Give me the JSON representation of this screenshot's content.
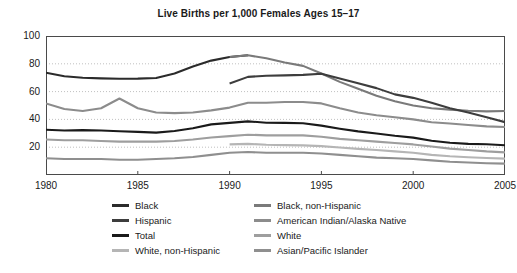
{
  "chart_data": {
    "type": "line",
    "title": "Live Births per 1,000 Females Ages 15–17",
    "xlabel": "",
    "ylabel": "",
    "xlim": [
      1980,
      2005
    ],
    "ylim": [
      0,
      100
    ],
    "grid": true,
    "gridlines_y": [
      20,
      40,
      60,
      80,
      100
    ],
    "legend_position": "bottom",
    "xticks": [
      1980,
      1985,
      1990,
      1995,
      2000,
      2005
    ],
    "xtick_labels": [
      "1980",
      "1985",
      "1990",
      "1995",
      "2000",
      "2005"
    ],
    "yticks": [
      20,
      40,
      60,
      80,
      100
    ],
    "ytick_labels": [
      "20",
      "40",
      "60",
      "80",
      "100"
    ],
    "series": [
      {
        "name": "Black",
        "color": "#2b2b2b",
        "x": [
          1980,
          1981,
          1982,
          1983,
          1984,
          1985,
          1986,
          1987,
          1988,
          1989,
          1990,
          1991
        ],
        "values": [
          73.6,
          71.0,
          70.0,
          69.5,
          69.2,
          69.3,
          69.8,
          73.0,
          78.0,
          82.3,
          84.9,
          86.1
        ]
      },
      {
        "name": "Black, non-Hispanic",
        "color": "#7a7a7a",
        "x": [
          1990,
          1991,
          1992,
          1993,
          1994,
          1995,
          1996,
          1997,
          1998,
          1999,
          2000,
          2001,
          2002,
          2003,
          2004,
          2005
        ],
        "values": [
          84.9,
          86.1,
          84.0,
          81.0,
          78.5,
          73.0,
          67.0,
          62.0,
          57.0,
          53.0,
          50.0,
          48.0,
          47.0,
          46.2,
          45.8,
          46.0
        ]
      },
      {
        "name": "Hispanic",
        "color": "#3d3d3d",
        "x": [
          1990,
          1991,
          1992,
          1993,
          1994,
          1995,
          1996,
          1997,
          1998,
          1999,
          2000,
          2001,
          2002,
          2003,
          2004,
          2005
        ],
        "values": [
          65.9,
          70.6,
          71.4,
          71.7,
          72.0,
          72.8,
          69.5,
          66.0,
          62.5,
          58.0,
          55.5,
          52.0,
          48.0,
          45.0,
          41.5,
          38.0
        ]
      },
      {
        "name": "American Indian/Alaska Native",
        "color": "#8c8c8c",
        "x": [
          1980,
          1981,
          1982,
          1983,
          1984,
          1985,
          1986,
          1987,
          1988,
          1989,
          1990,
          1991,
          1992,
          1993,
          1994,
          1995,
          1996,
          1997,
          1998,
          1999,
          2000,
          2001,
          2002,
          2003,
          2004,
          2005
        ],
        "values": [
          51.5,
          47.5,
          46.0,
          48.0,
          55.0,
          48.0,
          45.0,
          44.5,
          45.0,
          46.5,
          48.5,
          52.0,
          52.0,
          52.5,
          52.5,
          51.5,
          48.0,
          45.0,
          43.0,
          41.5,
          40.0,
          38.0,
          37.0,
          36.0,
          35.0,
          34.5
        ]
      },
      {
        "name": "Total",
        "color": "#1a1a1a",
        "x": [
          1980,
          1981,
          1982,
          1983,
          1984,
          1985,
          1986,
          1987,
          1988,
          1989,
          1990,
          1991,
          1992,
          1993,
          1994,
          1995,
          1996,
          1997,
          1998,
          1999,
          2000,
          2001,
          2002,
          2003,
          2004,
          2005
        ],
        "values": [
          32.5,
          32.0,
          32.3,
          32.0,
          31.5,
          31.0,
          30.5,
          31.7,
          33.6,
          36.4,
          37.5,
          38.6,
          37.6,
          37.5,
          37.2,
          35.5,
          33.3,
          31.4,
          29.9,
          28.2,
          26.9,
          24.7,
          23.2,
          22.4,
          22.1,
          21.4
        ]
      },
      {
        "name": "White",
        "color": "#9e9e9e",
        "x": [
          1980,
          1981,
          1982,
          1983,
          1984,
          1985,
          1986,
          1987,
          1988,
          1989,
          1990,
          1991,
          1992,
          1993,
          1994,
          1995,
          1996,
          1997,
          1998,
          1999,
          2000,
          2001,
          2002,
          2003,
          2004,
          2005
        ],
        "values": [
          25.5,
          25.0,
          25.0,
          24.5,
          24.0,
          24.0,
          24.0,
          24.5,
          25.5,
          27.0,
          28.0,
          29.0,
          28.5,
          28.5,
          28.5,
          27.5,
          26.0,
          25.0,
          24.0,
          23.0,
          22.0,
          20.5,
          19.0,
          18.0,
          17.0,
          16.3
        ]
      },
      {
        "name": "White, non-Hispanic",
        "color": "#b5b5b5",
        "x": [
          1990,
          1991,
          1992,
          1993,
          1994,
          1995,
          1996,
          1997,
          1998,
          1999,
          2000,
          2001,
          2002,
          2003,
          2004,
          2005
        ],
        "values": [
          22.0,
          22.4,
          21.8,
          21.5,
          21.3,
          20.8,
          19.8,
          18.8,
          18.0,
          17.0,
          16.0,
          14.5,
          13.5,
          12.8,
          12.2,
          11.8
        ]
      },
      {
        "name": "Asian/Pacific Islander",
        "color": "#8f8f8f",
        "x": [
          1980,
          1981,
          1982,
          1983,
          1984,
          1985,
          1986,
          1987,
          1988,
          1989,
          1990,
          1991,
          1992,
          1993,
          1994,
          1995,
          1996,
          1997,
          1998,
          1999,
          2000,
          2001,
          2002,
          2003,
          2004,
          2005
        ],
        "values": [
          12.0,
          11.5,
          11.5,
          11.5,
          11.0,
          11.0,
          11.5,
          12.0,
          13.0,
          14.5,
          16.0,
          16.5,
          16.0,
          16.0,
          16.0,
          15.5,
          14.5,
          13.5,
          12.5,
          12.0,
          11.5,
          10.5,
          9.5,
          9.0,
          8.5,
          8.2
        ]
      }
    ]
  },
  "legend": {
    "columns": [
      {
        "items": [
          {
            "label": "Black",
            "color": "#2b2b2b"
          },
          {
            "label": "Hispanic",
            "color": "#3d3d3d"
          },
          {
            "label": "Total",
            "color": "#1a1a1a"
          },
          {
            "label": "White, non-Hispanic",
            "color": "#b5b5b5"
          }
        ]
      },
      {
        "items": [
          {
            "label": "Black, non-Hispanic",
            "color": "#7a7a7a"
          },
          {
            "label": "American Indian/Alaska Native",
            "color": "#8c8c8c"
          },
          {
            "label": "White",
            "color": "#9e9e9e"
          },
          {
            "label": "Asian/Pacific Islander",
            "color": "#8f8f8f"
          }
        ]
      }
    ]
  }
}
